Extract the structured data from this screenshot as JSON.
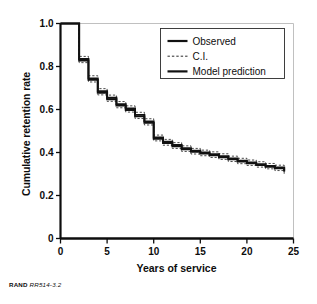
{
  "figure": {
    "credit_org": "RAND",
    "credit_id": "RR514-3.2"
  },
  "chart_data": {
    "type": "line",
    "title": "",
    "subtitle": "",
    "xlabel": "Years of service",
    "ylabel": "Cumulative retention rate",
    "xlim": [
      0,
      25
    ],
    "ylim": [
      0,
      1.0
    ],
    "xticks": [
      0,
      5,
      10,
      15,
      20,
      25
    ],
    "xtick_labels": [
      "0",
      "5",
      "10",
      "15",
      "20",
      "25"
    ],
    "yticks": [
      0,
      0.2,
      0.4,
      0.6,
      0.8,
      1.0
    ],
    "ytick_labels": [
      "0",
      "0.2",
      "0.4",
      "0.6",
      "0.8",
      "1.0"
    ],
    "grid": false,
    "step_style": "post",
    "legend_position": "top-right",
    "legend": [
      {
        "label": "Observed",
        "style": "solid",
        "width": 2.2,
        "color": "#111111"
      },
      {
        "label": "C.I.",
        "style": "dashed",
        "width": 0.9,
        "color": "#111111"
      },
      {
        "label": "Model prediction",
        "style": "solid",
        "width": 2.2,
        "color": "#111111"
      }
    ],
    "x": [
      0,
      1,
      2,
      3,
      4,
      5,
      6,
      7,
      8,
      9,
      10,
      11,
      12,
      13,
      14,
      15,
      16,
      17,
      18,
      19,
      20,
      21,
      22,
      23,
      24
    ],
    "series": [
      {
        "name": "Observed",
        "style": "solid",
        "values": [
          1.0,
          1.0,
          0.835,
          0.745,
          0.685,
          0.655,
          0.625,
          0.605,
          0.575,
          0.545,
          0.47,
          0.45,
          0.435,
          0.42,
          0.408,
          0.4,
          0.392,
          0.383,
          0.372,
          0.362,
          0.354,
          0.346,
          0.338,
          0.33,
          0.315
        ]
      },
      {
        "name": "Model prediction",
        "style": "solid",
        "values": [
          1.0,
          1.0,
          0.828,
          0.738,
          0.678,
          0.648,
          0.618,
          0.598,
          0.568,
          0.538,
          0.464,
          0.444,
          0.429,
          0.415,
          0.403,
          0.395,
          0.387,
          0.378,
          0.368,
          0.358,
          0.35,
          0.342,
          0.334,
          0.326,
          0.311
        ]
      },
      {
        "name": "C.I. upper",
        "style": "dashed",
        "values": [
          1.0,
          1.0,
          0.847,
          0.757,
          0.697,
          0.667,
          0.637,
          0.617,
          0.587,
          0.557,
          0.481,
          0.461,
          0.446,
          0.431,
          0.419,
          0.411,
          0.403,
          0.394,
          0.383,
          0.373,
          0.365,
          0.357,
          0.349,
          0.341,
          0.326
        ]
      },
      {
        "name": "C.I. lower",
        "style": "dashed",
        "values": [
          1.0,
          1.0,
          0.818,
          0.728,
          0.668,
          0.638,
          0.608,
          0.588,
          0.558,
          0.528,
          0.454,
          0.434,
          0.419,
          0.405,
          0.393,
          0.385,
          0.377,
          0.368,
          0.358,
          0.348,
          0.34,
          0.332,
          0.324,
          0.316,
          0.301
        ]
      }
    ]
  }
}
